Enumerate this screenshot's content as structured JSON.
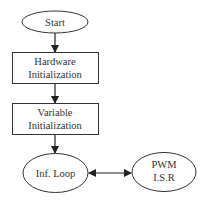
{
  "diagram": {
    "type": "flowchart",
    "colors": {
      "stroke": "#333333",
      "fill": "#ffffff",
      "text": "#333333"
    },
    "nodes": [
      {
        "id": "start",
        "shape": "ellipse",
        "lines": [
          "Start"
        ]
      },
      {
        "id": "hardware_init",
        "shape": "rectangle",
        "lines": [
          "Hardware",
          "Initialization"
        ]
      },
      {
        "id": "variable_init",
        "shape": "rectangle",
        "lines": [
          "Variable",
          "Initialization"
        ]
      },
      {
        "id": "inf_loop",
        "shape": "ellipse",
        "lines": [
          "Inf. Loop"
        ]
      },
      {
        "id": "pwm_isr",
        "shape": "ellipse",
        "lines": [
          "PWM",
          "I.S.R"
        ]
      }
    ],
    "edges": [
      {
        "from": "start",
        "to": "hardware_init",
        "direction": "forward"
      },
      {
        "from": "hardware_init",
        "to": "variable_init",
        "direction": "forward"
      },
      {
        "from": "variable_init",
        "to": "inf_loop",
        "direction": "forward"
      },
      {
        "from": "inf_loop",
        "to": "pwm_isr",
        "direction": "bidirectional"
      }
    ]
  }
}
